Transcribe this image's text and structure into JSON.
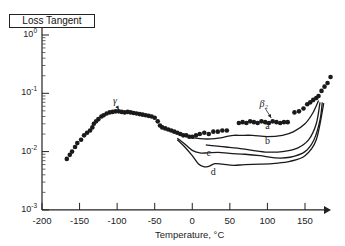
{
  "chart_data": {
    "type": "line",
    "title": "",
    "xlabel": "Temperature, °C",
    "ylabel": "Loss Tangent",
    "xlim": [
      -200,
      180
    ],
    "ylim": [
      0.001,
      1
    ],
    "yscale": "log",
    "grid": false,
    "legend": "none",
    "x_ticks": [
      -200,
      -150,
      -100,
      -50,
      0,
      50,
      100,
      150
    ],
    "x_tick_labels": [
      "-200",
      "-150",
      "-100",
      "-50",
      "0",
      "50",
      "100",
      "150"
    ],
    "y_ticks": [
      1,
      0.1,
      0.01,
      0.001
    ],
    "y_tick_labels": [
      {
        "base": "10",
        "exp": "0"
      },
      {
        "base": "10",
        "exp": "-1"
      },
      {
        "base": "10",
        "exp": "-2"
      },
      {
        "base": "10",
        "exp": "-3"
      }
    ],
    "annotations": [
      {
        "text": "γ",
        "x": -103,
        "y": 0.065,
        "arrow_to": [
          -98,
          0.049
        ]
      },
      {
        "text": "β₂",
        "x": 95,
        "y": 0.058,
        "arrow_to": [
          105,
          0.035
        ]
      },
      {
        "text": "a",
        "x": 100,
        "y": 0.024
      },
      {
        "text": "b",
        "x": 100,
        "y": 0.0135
      },
      {
        "text": "c",
        "x": 22,
        "y": 0.0085
      },
      {
        "text": "d",
        "x": 28,
        "y": 0.0039
      }
    ],
    "series": [
      {
        "name": "measured (dots)",
        "style": "scatter",
        "x": [
          -167,
          -163,
          -160,
          -156,
          -153,
          -148,
          -144,
          -140,
          -136,
          -133,
          -131,
          -128,
          -125,
          -121,
          -118,
          -114,
          -110,
          -106,
          -102,
          -98,
          -94,
          -90,
          -86,
          -82,
          -78,
          -74,
          -70,
          -66,
          -62,
          -58,
          -54,
          -50,
          -46,
          -43,
          -40,
          -36,
          -32,
          -28,
          -24,
          -20,
          -16,
          -12,
          -8,
          -4,
          0,
          5,
          10,
          16,
          22,
          28,
          34,
          40,
          46
        ],
        "y": [
          0.0075,
          0.0088,
          0.01,
          0.012,
          0.014,
          0.016,
          0.019,
          0.021,
          0.023,
          0.026,
          0.03,
          0.033,
          0.036,
          0.04,
          0.042,
          0.045,
          0.047,
          0.048,
          0.049,
          0.049,
          0.048,
          0.047,
          0.048,
          0.047,
          0.046,
          0.045,
          0.044,
          0.043,
          0.042,
          0.041,
          0.04,
          0.038,
          0.033,
          0.028,
          0.026,
          0.025,
          0.024,
          0.023,
          0.022,
          0.021,
          0.02,
          0.019,
          0.019,
          0.018,
          0.018,
          0.019,
          0.02,
          0.021,
          0.02,
          0.022,
          0.022,
          0.023,
          0.023
        ]
      },
      {
        "name": "β2 (dots)",
        "style": "scatter",
        "x": [
          62,
          67,
          72,
          77,
          82,
          87,
          92,
          97,
          102,
          107,
          112,
          117,
          122,
          127,
          136,
          142,
          148,
          153,
          157,
          161,
          165,
          168,
          172,
          176,
          180,
          184
        ],
        "y": [
          0.031,
          0.032,
          0.031,
          0.033,
          0.032,
          0.031,
          0.033,
          0.032,
          0.031,
          0.033,
          0.032,
          0.031,
          0.032,
          0.032,
          0.047,
          0.049,
          0.055,
          0.065,
          0.07,
          0.077,
          0.083,
          0.09,
          0.11,
          0.13,
          0.15,
          0.19
        ]
      },
      {
        "name": "a",
        "style": "line",
        "x": [
          -5,
          5,
          15,
          25,
          35,
          45,
          55,
          65,
          80,
          100,
          120,
          135,
          150,
          160,
          168
        ],
        "y": [
          0.018,
          0.017,
          0.0165,
          0.0165,
          0.017,
          0.018,
          0.019,
          0.019,
          0.019,
          0.018,
          0.019,
          0.022,
          0.03,
          0.045,
          0.075
        ]
      },
      {
        "name": "b",
        "style": "line",
        "x": [
          18,
          30,
          45,
          60,
          80,
          100,
          120,
          140,
          155,
          165,
          170
        ],
        "y": [
          0.013,
          0.0125,
          0.012,
          0.0115,
          0.0105,
          0.0098,
          0.01,
          0.0115,
          0.016,
          0.03,
          0.07
        ]
      },
      {
        "name": "c",
        "style": "line",
        "x": [
          -20,
          -10,
          0,
          10,
          20,
          35,
          50,
          70,
          90,
          110,
          130,
          150,
          162,
          170,
          173
        ],
        "y": [
          0.017,
          0.0135,
          0.0105,
          0.0095,
          0.0095,
          0.0097,
          0.0093,
          0.009,
          0.0085,
          0.0078,
          0.008,
          0.01,
          0.016,
          0.035,
          0.07
        ]
      },
      {
        "name": "d",
        "style": "line",
        "x": [
          -20,
          -10,
          0,
          8,
          15,
          22,
          30,
          40,
          55,
          70,
          90,
          110,
          130,
          150,
          165,
          175
        ],
        "y": [
          0.016,
          0.012,
          0.0085,
          0.0062,
          0.0055,
          0.0056,
          0.0062,
          0.0061,
          0.0058,
          0.006,
          0.0061,
          0.0063,
          0.0068,
          0.0085,
          0.016,
          0.068
        ]
      }
    ]
  }
}
